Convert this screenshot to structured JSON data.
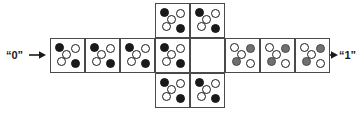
{
  "diagram": {
    "width": 363,
    "height": 113,
    "colors": {
      "filled_black": "#1a1a1a",
      "filled_gray": "#707070",
      "empty_white": "#ffffff",
      "cell_border": "#4a4a4a",
      "text": "#1a1a1a",
      "background": "#ffffff"
    }
  },
  "labels": {
    "input": {
      "text": "“0”",
      "position": "left"
    },
    "output": {
      "text": "“1”",
      "position": "right"
    }
  },
  "arrows": {
    "left_arrow": "arrow-right-icon",
    "right_arrow": "arrow-right-icon"
  },
  "geometry": {
    "cell_size": 35,
    "middle_row_top": 38,
    "top_row_top": 3,
    "bottom_row_top": 73,
    "row_left_start": 50,
    "dot_diameter": 9,
    "dot_offsets": [
      {
        "name": "top-left",
        "x": 4,
        "y": 4
      },
      {
        "name": "top-right",
        "x": 20,
        "y": 5
      },
      {
        "name": "center-upper",
        "x": 11,
        "y": 11
      },
      {
        "name": "center-lower",
        "x": 6,
        "y": 18
      },
      {
        "name": "bottom-right",
        "x": 20,
        "y": 20
      }
    ]
  },
  "patterns": {
    "black_pattern": {
      "name": "black-dot-pattern",
      "dots": [
        "black",
        "white",
        "white",
        "white",
        "black"
      ]
    },
    "gray_pattern": {
      "name": "gray-dot-pattern",
      "dots": [
        "white",
        "gray",
        "white",
        "gray",
        "white"
      ]
    },
    "empty_pattern": {
      "name": "empty-pattern",
      "dots": []
    }
  },
  "rows": {
    "top": {
      "name": "top-row",
      "cells": [
        {
          "id": "top-1",
          "col": 3,
          "pattern": "black_pattern"
        },
        {
          "id": "top-2",
          "col": 4,
          "pattern": "black_pattern"
        }
      ]
    },
    "middle": {
      "name": "middle-row",
      "cells": [
        {
          "id": "mid-1",
          "col": 0,
          "pattern": "black_pattern"
        },
        {
          "id": "mid-2",
          "col": 1,
          "pattern": "black_pattern"
        },
        {
          "id": "mid-3",
          "col": 2,
          "pattern": "black_pattern"
        },
        {
          "id": "mid-4",
          "col": 3,
          "pattern": "black_pattern"
        },
        {
          "id": "mid-5",
          "col": 4,
          "pattern": "empty_pattern"
        },
        {
          "id": "mid-6",
          "col": 5,
          "pattern": "gray_pattern"
        },
        {
          "id": "mid-7",
          "col": 6,
          "pattern": "gray_pattern"
        },
        {
          "id": "mid-8",
          "col": 7,
          "pattern": "gray_pattern"
        }
      ]
    },
    "bottom": {
      "name": "bottom-row",
      "cells": [
        {
          "id": "bot-1",
          "col": 3,
          "pattern": "black_pattern"
        },
        {
          "id": "bot-2",
          "col": 4,
          "pattern": "black_pattern"
        }
      ]
    }
  }
}
